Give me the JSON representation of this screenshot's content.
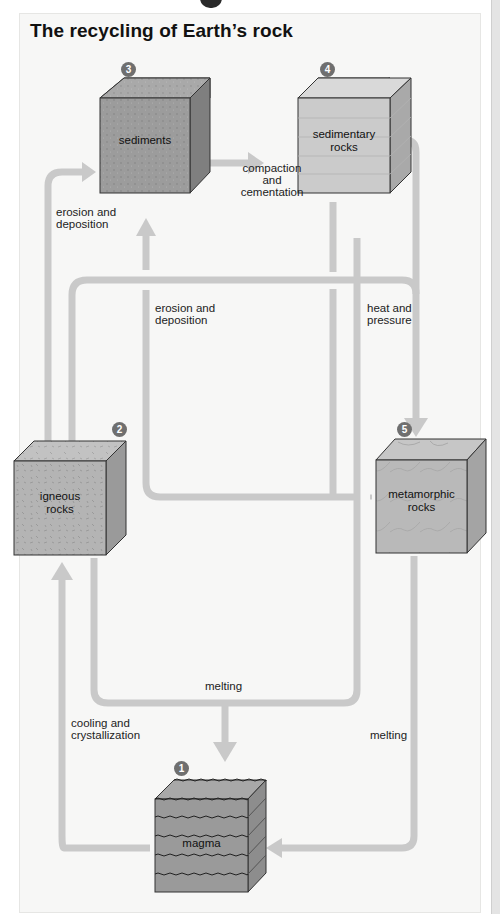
{
  "title": "The recycling of Earth’s rock",
  "colors": {
    "panel_bg": "#f7f7f6",
    "arrow": "#c9c9c9",
    "cube_dark": "#9a9a9a",
    "cube_light": "#c4c4c4",
    "badge": "#6f6f6f"
  },
  "stages": [
    {
      "id": 1,
      "badge": "1",
      "label": "magma"
    },
    {
      "id": 2,
      "badge": "2",
      "label": "igneous rocks"
    },
    {
      "id": 3,
      "badge": "3",
      "label": "sediments"
    },
    {
      "id": 4,
      "badge": "4",
      "label": "sedimentary rocks"
    },
    {
      "id": 5,
      "badge": "5",
      "label": "metamorphic rocks"
    }
  ],
  "box_labels": {
    "sediments": "sediments",
    "sedimentary_1": "sedimentary",
    "sedimentary_2": "rocks",
    "igneous_1": "igneous",
    "igneous_2": "rocks",
    "metamorphic_1": "metamorphic",
    "metamorphic_2": "rocks",
    "magma": "magma"
  },
  "processes": {
    "compaction_1": "compaction",
    "compaction_2": "and",
    "compaction_3": "cementation",
    "erosion_left_1": "erosion and",
    "erosion_left_2": "deposition",
    "erosion_center_1": "erosion and",
    "erosion_center_2": "deposition",
    "heat_1": "heat and",
    "heat_2": "pressure",
    "melting_center": "melting",
    "cooling_1": "cooling and",
    "cooling_2": "crystallization",
    "melting_right": "melting"
  },
  "transitions": [
    {
      "from": "sediments",
      "to": "sedimentary rocks",
      "process": "compaction and cementation"
    },
    {
      "from": "igneous rocks",
      "to": "sediments",
      "process": "erosion and deposition"
    },
    {
      "from": "metamorphic rocks",
      "to": "sediments",
      "process": "erosion and deposition"
    },
    {
      "from": "sedimentary rocks",
      "to": "metamorphic rocks",
      "process": "heat and pressure"
    },
    {
      "from": "igneous rocks",
      "to": "metamorphic rocks",
      "process": "heat and pressure"
    },
    {
      "from": "igneous rocks",
      "to": "magma",
      "process": "melting"
    },
    {
      "from": "sedimentary rocks",
      "to": "magma",
      "process": "melting"
    },
    {
      "from": "magma",
      "to": "igneous rocks",
      "process": "cooling and crystallization"
    },
    {
      "from": "metamorphic rocks",
      "to": "magma",
      "process": "melting"
    }
  ]
}
